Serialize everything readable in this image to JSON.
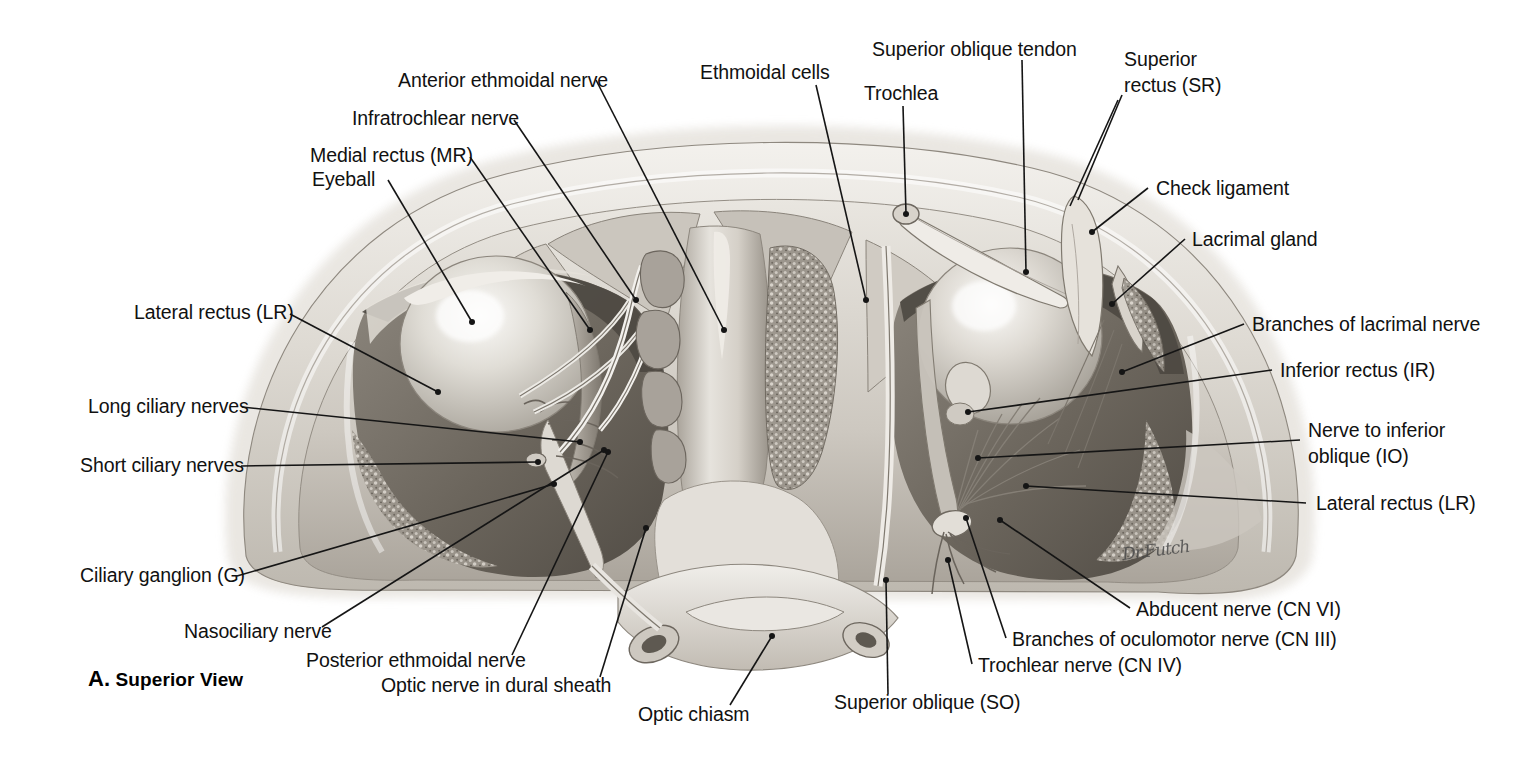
{
  "figure": {
    "caption_letter": "A.",
    "caption_text": "Superior View",
    "artist_signature": "Dr.Futch",
    "background_color": "#ffffff",
    "ink_color": "#151515",
    "tissue_light": "#e8e6e2",
    "tissue_mid": "#b9b5ae",
    "tissue_dark": "#6f6a63",
    "bone_color": "#d9d5ce"
  },
  "labels": {
    "anterior_ethmoidal_nerve": "Anterior ethmoidal nerve",
    "infratrochlear_nerve": "Infratrochlear nerve",
    "medial_rectus": "Medial rectus (MR)",
    "eyeball": "Eyeball",
    "lateral_rectus_left": "Lateral rectus (LR)",
    "long_ciliary_nerves": "Long ciliary nerves",
    "short_ciliary_nerves": "Short ciliary nerves",
    "ciliary_ganglion": "Ciliary ganglion (G)",
    "nasociliary_nerve": "Nasociliary nerve",
    "posterior_ethmoidal_nerve": "Posterior ethmoidal nerve",
    "optic_nerve_in_dural_sheath": "Optic nerve in dural sheath",
    "optic_chiasm": "Optic chiasm",
    "ethmoidal_cells": "Ethmoidal cells",
    "superior_oblique_tendon": "Superior oblique tendon",
    "trochlea": "Trochlea",
    "superior_rectus_line1": "Superior",
    "superior_rectus_line2": "rectus (SR)",
    "check_ligament": "Check ligament",
    "lacrimal_gland": "Lacrimal gland",
    "branches_of_lacrimal_nerve": "Branches of lacrimal nerve",
    "inferior_rectus": "Inferior rectus (IR)",
    "nerve_to_inferior_oblique_line1": "Nerve to inferior",
    "nerve_to_inferior_oblique_line2": "oblique (IO)",
    "lateral_rectus_right": "Lateral rectus (LR)",
    "abducent_nerve": "Abducent nerve (CN VI)",
    "branches_of_oculomotor_nerve": "Branches of oculomotor nerve (CN III)",
    "trochlear_nerve": "Trochlear nerve (CN IV)",
    "superior_oblique": "Superior oblique (SO)"
  }
}
